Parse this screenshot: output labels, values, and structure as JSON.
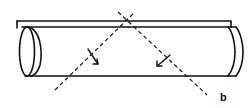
{
  "diagram": {
    "labels": {
      "b": "b"
    },
    "colors": {
      "stroke": "#111111",
      "background": "#ffffff"
    },
    "elements": [
      {
        "name": "top-plate",
        "type": "line-pair"
      },
      {
        "name": "tube-body",
        "type": "cylinder"
      },
      {
        "name": "left-end-ellipse",
        "type": "ellipse"
      },
      {
        "name": "right-end-cap",
        "type": "curve"
      },
      {
        "name": "dashed-axis-a",
        "type": "dashed-line",
        "direction": "ascending"
      },
      {
        "name": "dashed-axis-b",
        "type": "dashed-line",
        "direction": "descending",
        "label": "b"
      },
      {
        "name": "rotation-arrow-left",
        "type": "arrow"
      },
      {
        "name": "rotation-arrow-right",
        "type": "arrow"
      }
    ]
  }
}
